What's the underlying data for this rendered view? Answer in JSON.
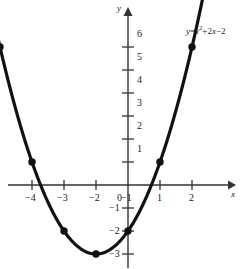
{
  "chart_data": {
    "type": "line",
    "title": "",
    "subtitle": "",
    "xlabel": "x",
    "ylabel": "y",
    "equation_text": "y = x² + 2x − 2",
    "equation_parts": {
      "lhs": "y",
      "equals": "=",
      "var1": "x",
      "exponent": "2",
      "plus": "+2",
      "var2": "x",
      "minus": "−2"
    },
    "annotations": [
      "y = x² + 2x − 2"
    ],
    "grid": false,
    "legend_position": "none",
    "xlim": [
      -4.6,
      2.6
    ],
    "ylim": [
      -3.5,
      6.8
    ],
    "xticks": [
      -4,
      -3,
      -2,
      -1,
      0,
      1,
      2
    ],
    "xtick_labels": [
      "−4",
      "−3",
      "−2",
      "−1",
      "0",
      "1",
      "2"
    ],
    "yticks": [
      6,
      5,
      4,
      3,
      2,
      1,
      -1,
      -2,
      -3
    ],
    "ytick_labels": [
      "6",
      "5",
      "4",
      "3",
      "2",
      "1",
      "−1",
      "−2",
      "−3"
    ],
    "origin_label": "0",
    "x": [
      -4,
      -3,
      -2,
      -1,
      0,
      1,
      2
    ],
    "values": [
      6,
      1,
      -2,
      -3,
      -2,
      1,
      6
    ],
    "points": [
      {
        "x": -4,
        "y": 6
      },
      {
        "x": -3,
        "y": 1
      },
      {
        "x": -2,
        "y": -2
      },
      {
        "x": -1,
        "y": -3
      },
      {
        "x": 0,
        "y": -2
      },
      {
        "x": 1,
        "y": 1
      },
      {
        "x": 2,
        "y": 6
      }
    ],
    "vertex": {
      "x": -1,
      "y": -3
    },
    "curve_color": "#111111",
    "axis_color": "#333333",
    "marker_color": "#111111",
    "background_color": "#ffffff"
  }
}
